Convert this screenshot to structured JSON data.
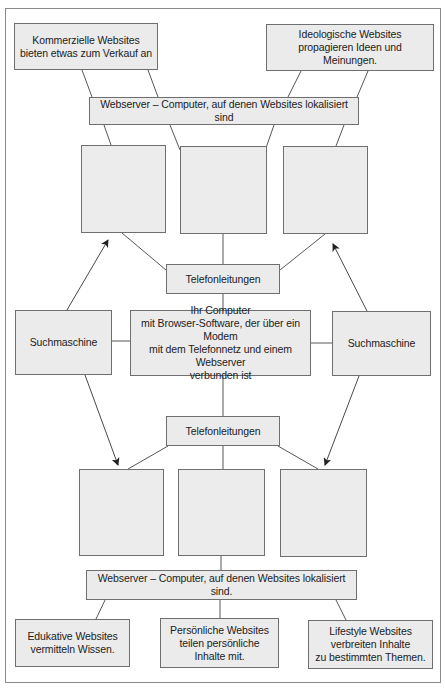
{
  "diagram": {
    "colors": {
      "box_fill": "#ebebeb",
      "box_border": "#6f6f6f",
      "line": "#444444",
      "frame": "#8a8a8a"
    },
    "top": {
      "commercial": "Kommerzielle Websites\nbieten etwas zum Verkauf an",
      "ideological": "Ideologische Websites\npropagieren Ideen und Meinungen.",
      "webserver": "Webserver – Computer, auf denen Websites lokalisiert sind"
    },
    "top_site_boxes": [
      "",
      "",
      ""
    ],
    "phone_lines_top": "Telefonleitungen",
    "search_engine_left": "Suchmaschine",
    "your_computer": "Ihr Computer\nmit Browser-Software, der über ein Modem\nmit dem Telefonnetz und einem Webserver\nverbunden ist",
    "search_engine_right": "Suchmaschine",
    "phone_lines_bottom": "Telefonleitungen",
    "bottom_site_boxes": [
      "",
      "",
      ""
    ],
    "bottom": {
      "webserver": "Webserver – Computer, auf denen Websites lokalisiert sind.",
      "educational": "Edukative Websites\nvermitteln Wissen.",
      "personal": "Persönliche Websites\nteilen persönliche\nInhalte mit.",
      "lifestyle": "Lifestyle Websites\nverbreiten Inhalte\nzu bestimmten Themen."
    }
  }
}
